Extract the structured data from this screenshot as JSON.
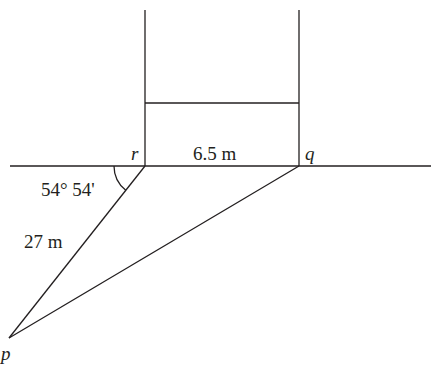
{
  "diagram": {
    "points": {
      "r": {
        "label": "r",
        "x": 145,
        "y": 166
      },
      "q": {
        "label": "q",
        "x": 299,
        "y": 166
      },
      "p": {
        "label": "p",
        "x": 9,
        "y": 338
      }
    },
    "labels": {
      "rq_length": "6.5 m",
      "rp_length": "27 m",
      "angle_r": "54° 54'"
    },
    "line_color": "#231f20",
    "background": "#ffffff"
  }
}
